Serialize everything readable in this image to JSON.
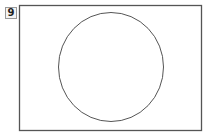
{
  "figure": {
    "number": "9",
    "rectangle": {
      "x": 19,
      "y": 5,
      "width": 183,
      "height": 126,
      "stroke": "#555555"
    },
    "circle": {
      "cx": 111,
      "cy": 67,
      "r": 52.5,
      "stroke": "#555555"
    }
  }
}
